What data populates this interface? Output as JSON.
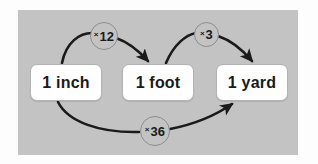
{
  "diagram": {
    "panel_color": "#c3c3c3",
    "background_color": "#ffffff",
    "arrow_color": "#1a1a1a",
    "box_fill_color": "#fefefe",
    "box_border_color": "#b2b2b2",
    "badge_fill_color": "#c3c3c3",
    "badge_border_color": "#8d8d8d",
    "nodes": [
      {
        "id": "inch",
        "label": "1 inch"
      },
      {
        "id": "foot",
        "label": "1 foot"
      },
      {
        "id": "yard",
        "label": "1 yard"
      }
    ],
    "edges": [
      {
        "id": "inch-to-foot",
        "from": "inch",
        "to": "foot",
        "operator": "×",
        "factor": "12",
        "label": "× 12",
        "arc": "top"
      },
      {
        "id": "foot-to-yard",
        "from": "foot",
        "to": "yard",
        "operator": "×",
        "factor": "3",
        "label": "×3",
        "arc": "top"
      },
      {
        "id": "inch-to-yard",
        "from": "inch",
        "to": "yard",
        "operator": "×",
        "factor": "36",
        "label": "×36",
        "arc": "bottom"
      }
    ]
  }
}
